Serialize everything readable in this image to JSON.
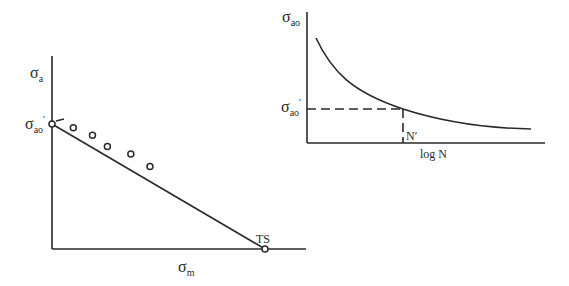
{
  "left_diagram": {
    "title": "Goodman-type diagram",
    "y_axis_label": {
      "main": "σ",
      "sub": "a"
    },
    "x_axis_label": {
      "main": "σ",
      "sub": "m"
    },
    "intercept_label": {
      "main": "σ",
      "sub": "ao",
      "prime": "'"
    },
    "endpoint_label": "TS",
    "line_description": "straight line from σao' on the stress-amplitude axis to TS on the mean-stress axis",
    "data_points_relative": [
      {
        "sm": 0.1,
        "sa": 0.97
      },
      {
        "sm": 0.19,
        "sa": 0.91
      },
      {
        "sm": 0.26,
        "sa": 0.82
      },
      {
        "sm": 0.37,
        "sa": 0.76
      },
      {
        "sm": 0.46,
        "sa": 0.66
      }
    ]
  },
  "right_diagram": {
    "title": "S-N curve",
    "y_axis_label": {
      "main": "σ",
      "sub": "ao"
    },
    "x_axis_label": "log N",
    "marker_y_label": {
      "main": "σ",
      "sub": "ao",
      "prime": "'"
    },
    "marker_x_label": "N′",
    "curve_description": "monotonically decreasing curve approaching a horizontal asymptote",
    "marker_relative": {
      "logN": 0.41,
      "stress": 0.26
    }
  },
  "colors": {
    "ink": "#2a2a2a",
    "background": "#ffffff"
  }
}
